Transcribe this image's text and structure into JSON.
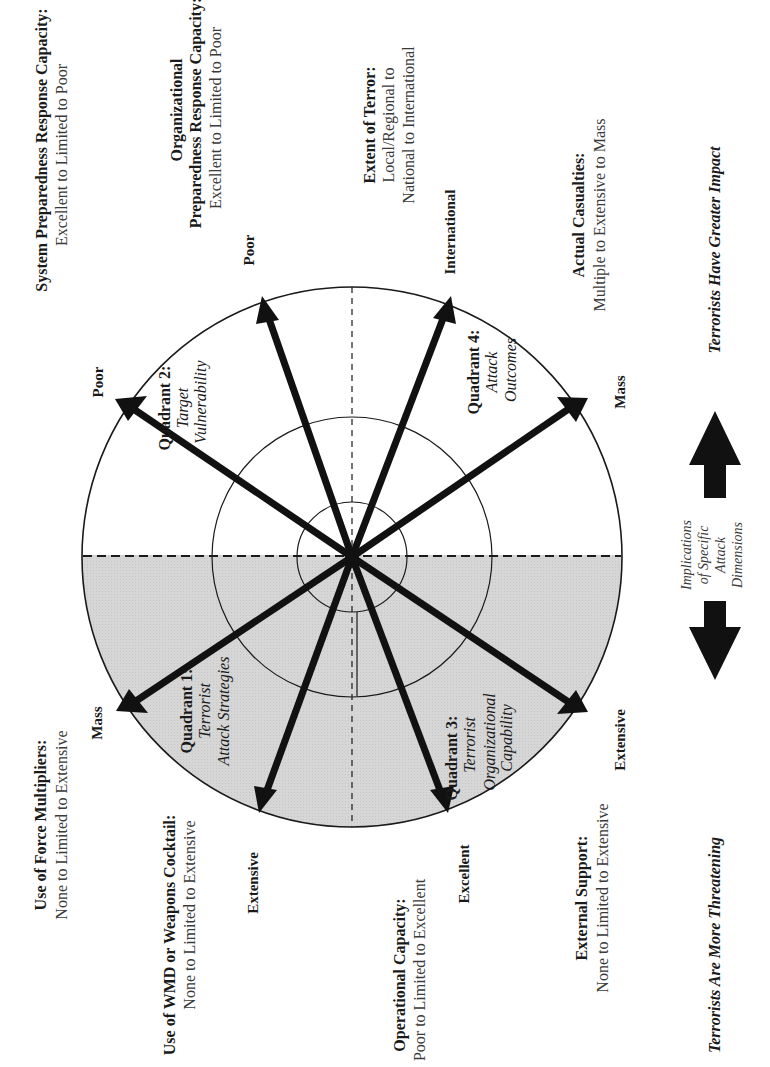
{
  "figure": {
    "colors": {
      "background": "#ffffff",
      "shaded_half": "#d4d4d4",
      "lines": "#1a1a1a",
      "arrows": "#111111"
    },
    "dimensions": [
      {
        "id": "system-preparedness",
        "title": "System Preparedness Response Capacity:",
        "range": "Excellent to Limited to Poor",
        "endpoint": "Poor",
        "quadrant": 2
      },
      {
        "id": "organizational-preparedness",
        "title_line1": "Organizational",
        "title_line2": "Preparedness Response Capacity:",
        "range": "Excellent to Limited to Poor",
        "endpoint": "Poor",
        "quadrant": 2
      },
      {
        "id": "extent-of-terror",
        "title": "Extent of Terror:",
        "range_line1": "Local/Regional to",
        "range_line2": "National to International",
        "endpoint": "International",
        "quadrant": 4
      },
      {
        "id": "actual-casualties",
        "title": "Actual Casualties:",
        "range": "Multiple to Extensive to Mass",
        "endpoint": "Mass",
        "quadrant": 4
      },
      {
        "id": "external-support",
        "title": "External Support:",
        "range": "None to Limited to Extensive",
        "endpoint": "Extensive",
        "quadrant": 3
      },
      {
        "id": "operational-capacity",
        "title": "Operational Capacity:",
        "range": "Poor to Limited to Excellent",
        "endpoint": "Excellent",
        "quadrant": 3
      },
      {
        "id": "wmd-weapons-cocktail",
        "title": "Use of WMD or Weapons Cocktail:",
        "range": "None to Limited to Extensive",
        "endpoint": "Extensive",
        "quadrant": 1
      },
      {
        "id": "force-multipliers",
        "title": "Use of Force Multipliers:",
        "range": "None to Limited to Extensive",
        "endpoint": "Mass",
        "quadrant": 1
      }
    ],
    "quadrants": [
      {
        "id": 1,
        "title": "Quadrant 1:",
        "sub_line1": "Terrorist",
        "sub_line2": "Attack Strategies"
      },
      {
        "id": 2,
        "title": "Quadrant 2:",
        "sub_line1": "Target",
        "sub_line2": "Vulnerability"
      },
      {
        "id": 3,
        "title": "Quadrant 3:",
        "sub_line1": "Terrorist",
        "sub_line2": "Organizational",
        "sub_line3": "Capability"
      },
      {
        "id": 4,
        "title": "Quadrant 4:",
        "sub_line1": "Attack",
        "sub_line2": "Outcomes"
      }
    ],
    "legend": {
      "implications_line1": "Implications",
      "implications_line2": "of Specific",
      "implications_line3": "Attack",
      "implications_line4": "Dimensions",
      "greater_impact": "Terrorists Have Greater Impact",
      "more_threatening": "Terrorists Are More Threatening"
    }
  }
}
